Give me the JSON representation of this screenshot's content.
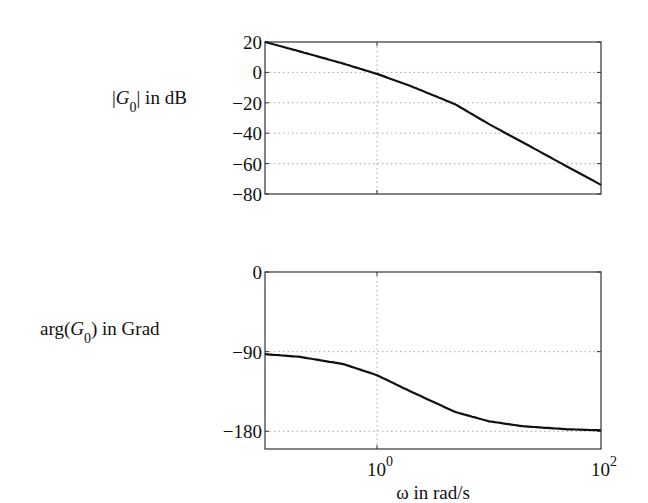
{
  "chart_data": [
    {
      "type": "line",
      "title": "",
      "ylabel_main": "|G",
      "ylabel_sub": "0",
      "ylabel_tail": "| in dB",
      "xscale": "log",
      "xlim": [
        0.1,
        100
      ],
      "ylim": [
        -80,
        20
      ],
      "yticks": [
        20,
        0,
        -20,
        -40,
        -60,
        -80
      ],
      "ytick_labels": [
        "20",
        "0",
        "−20",
        "−40",
        "−60",
        "−80"
      ],
      "xgrid": [
        1
      ],
      "ygrid": [
        0,
        -20,
        -40,
        -60
      ],
      "grid": true,
      "series": [
        {
          "name": "magnitude",
          "x": [
            0.1,
            0.2,
            0.5,
            1,
            2,
            5,
            10,
            20,
            50,
            100
          ],
          "y": [
            20,
            14,
            5.8,
            -1,
            -9,
            -21,
            -34,
            -46,
            -62,
            -74
          ]
        }
      ]
    },
    {
      "type": "line",
      "title": "",
      "ylabel_main": "arg(G",
      "ylabel_sub": "0",
      "ylabel_tail": ")  in Grad",
      "xlabel": "ω  in rad/s",
      "xscale": "log",
      "xlim": [
        0.1,
        100
      ],
      "ylim": [
        -200,
        0
      ],
      "yticks": [
        0,
        -90,
        -180
      ],
      "ytick_labels": [
        "0",
        "−90",
        "−180"
      ],
      "xticks": [
        1,
        100
      ],
      "xtick_base": [
        "10",
        "10"
      ],
      "xtick_exp": [
        "0",
        "2"
      ],
      "xgrid": [
        1
      ],
      "ygrid": [
        -90,
        -180
      ],
      "grid": true,
      "series": [
        {
          "name": "phase",
          "x": [
            0.1,
            0.2,
            0.5,
            1,
            2,
            5,
            10,
            20,
            50,
            100
          ],
          "y": [
            -92.9,
            -95.7,
            -104,
            -116.6,
            -135,
            -158.2,
            -168.7,
            -174.3,
            -177.7,
            -178.9
          ]
        }
      ]
    }
  ]
}
